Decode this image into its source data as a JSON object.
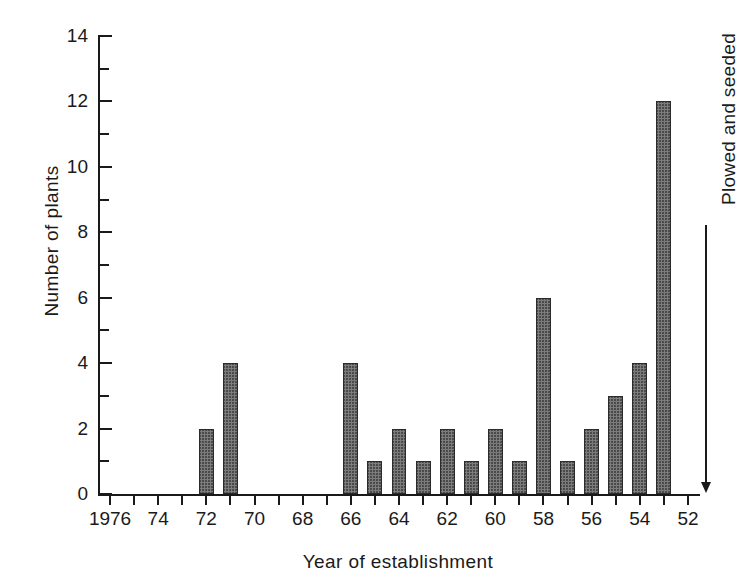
{
  "chart_data": {
    "type": "bar",
    "title": "",
    "subtitle": "",
    "xlabel": "Year of establishment",
    "ylabel": "Number of plants",
    "xlim": [
      1976.5,
      1951.5
    ],
    "ylim": [
      0,
      14
    ],
    "x_axis_reversed": true,
    "grid": false,
    "legend": "none",
    "y_ticks_major": [
      0,
      2,
      4,
      6,
      8,
      10,
      12,
      14
    ],
    "y_ticks_minor": [
      1,
      3,
      5,
      7,
      9,
      11,
      13
    ],
    "y_tick_labels": [
      "0",
      "2",
      "4",
      "6",
      "8",
      "10",
      "12",
      "14"
    ],
    "x_tick_years": [
      1976,
      1975,
      1974,
      1973,
      1972,
      1971,
      1970,
      1969,
      1968,
      1967,
      1966,
      1965,
      1964,
      1963,
      1962,
      1961,
      1960,
      1959,
      1958,
      1957,
      1956,
      1955,
      1954,
      1953,
      1952
    ],
    "x_tick_labels": [
      {
        "year": 1976,
        "label": "1976"
      },
      {
        "year": 1974,
        "label": "74"
      },
      {
        "year": 1972,
        "label": "72"
      },
      {
        "year": 1970,
        "label": "70"
      },
      {
        "year": 1968,
        "label": "68"
      },
      {
        "year": 1966,
        "label": "66"
      },
      {
        "year": 1964,
        "label": "64"
      },
      {
        "year": 1962,
        "label": "62"
      },
      {
        "year": 1960,
        "label": "60"
      },
      {
        "year": 1958,
        "label": "58"
      },
      {
        "year": 1956,
        "label": "56"
      },
      {
        "year": 1954,
        "label": "54"
      },
      {
        "year": 1952,
        "label": "52"
      }
    ],
    "categories": [
      1976,
      1975,
      1974,
      1973,
      1972,
      1971,
      1970,
      1969,
      1968,
      1967,
      1966,
      1965,
      1964,
      1963,
      1962,
      1961,
      1960,
      1959,
      1958,
      1957,
      1956,
      1955,
      1954,
      1953,
      1952
    ],
    "values": [
      0,
      0,
      0,
      0,
      2,
      4,
      0,
      0,
      0,
      0,
      4,
      1,
      2,
      1,
      2,
      1,
      2,
      1,
      6,
      1,
      2,
      3,
      4,
      12,
      0
    ],
    "bars": [
      {
        "year": 1972,
        "value": 2
      },
      {
        "year": 1971,
        "value": 4
      },
      {
        "year": 1966,
        "value": 4
      },
      {
        "year": 1965,
        "value": 1
      },
      {
        "year": 1964,
        "value": 2
      },
      {
        "year": 1963,
        "value": 1
      },
      {
        "year": 1962,
        "value": 2
      },
      {
        "year": 1961,
        "value": 1
      },
      {
        "year": 1960,
        "value": 2
      },
      {
        "year": 1959,
        "value": 1
      },
      {
        "year": 1958,
        "value": 6
      },
      {
        "year": 1957,
        "value": 1
      },
      {
        "year": 1956,
        "value": 2
      },
      {
        "year": 1955,
        "value": 3
      },
      {
        "year": 1954,
        "value": 4
      },
      {
        "year": 1953,
        "value": 12
      }
    ],
    "annotations": [
      {
        "text": "Plowed and seeded",
        "year": 1952,
        "arrow": "down",
        "orientation": "vertical"
      }
    ],
    "colors": {
      "bar_fill": "#7c7c7c",
      "bar_edge": "#2b2b2b",
      "axis": "#1a1a1a",
      "background": "#ffffff",
      "text": "#1a1a1a"
    }
  }
}
